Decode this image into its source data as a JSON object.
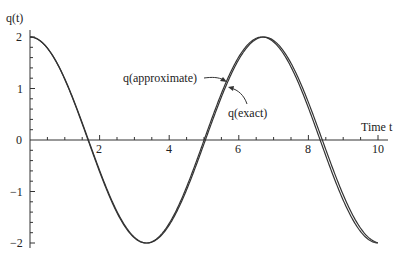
{
  "chart_data": {
    "type": "line",
    "title": "",
    "xlabel": "Time t",
    "ylabel": "q(t)",
    "xlim": [
      0,
      10
    ],
    "ylim": [
      -2,
      2
    ],
    "x_ticks": [
      "2",
      "4",
      "6",
      "8",
      "10"
    ],
    "y_ticks": [
      "2",
      "1",
      "0",
      "-1",
      "-2"
    ],
    "grid": false,
    "legend": "none (inline annotations with arrows)",
    "series": [
      {
        "name": "q(exact)",
        "formula_approx": "2*cos(0.935*t)",
        "x": [
          0,
          1,
          2,
          3,
          3.4,
          4,
          5,
          6,
          6.7,
          7,
          8,
          9,
          10
        ],
        "values": [
          2.0,
          1.19,
          -0.58,
          -1.88,
          -2.0,
          -1.66,
          -0.14,
          1.54,
          2.0,
          1.93,
          0.78,
          -0.99,
          -1.98
        ]
      },
      {
        "name": "q(approximate)",
        "formula_approx": "2*cos(0.94*t)",
        "x": [
          0,
          1,
          2,
          3,
          3.4,
          4,
          5,
          6,
          6.7,
          7,
          8,
          9,
          10
        ],
        "values": [
          2.0,
          1.18,
          -0.6,
          -1.9,
          -2.0,
          -1.64,
          -0.1,
          1.58,
          2.0,
          1.92,
          0.73,
          -1.04,
          -1.99
        ]
      }
    ],
    "annotations": [
      {
        "text": "q(approximate)",
        "points_to": "approximate curve near t≈5.6"
      },
      {
        "text": "q(exact)",
        "points_to": "exact curve near t≈5.7"
      }
    ]
  },
  "labels": {
    "ylabel": "q(t)",
    "xlabel": "Time t",
    "approx": "q(approximate)",
    "exact": "q(exact)",
    "yt2": "2",
    "yt1": "1",
    "yt0": "0",
    "ytm1": "−1",
    "ytm2": "−2",
    "xt2": "2",
    "xt4": "4",
    "xt6": "6",
    "xt8": "8",
    "xt10": "10"
  }
}
